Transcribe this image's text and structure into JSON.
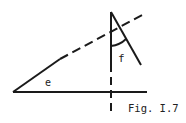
{
  "figure": {
    "caption": "Fig. I.7",
    "angle_labels": {
      "e": "e",
      "f": "f"
    },
    "colors": {
      "stroke": "#1a1a1a",
      "background": "#ffffff"
    },
    "elements": [
      {
        "name": "baseline",
        "style": "solid",
        "from": [
          13,
          92
        ],
        "to": [
          147,
          92
        ]
      },
      {
        "name": "slanted-line-solid",
        "style": "solid",
        "from": [
          13,
          92
        ],
        "to": [
          60,
          59
        ]
      },
      {
        "name": "slanted-line-dashed",
        "style": "dashed",
        "from": [
          60,
          59
        ],
        "to": [
          146,
          13
        ]
      },
      {
        "name": "vertical-line-solid",
        "style": "solid",
        "from": [
          111,
          12
        ],
        "to": [
          111,
          64
        ]
      },
      {
        "name": "vertical-line-dashed",
        "style": "dashed",
        "from": [
          111,
          64
        ],
        "to": [
          111,
          113
        ]
      },
      {
        "name": "apex-slant-line",
        "style": "solid",
        "from": [
          111,
          12
        ],
        "to": [
          141,
          65
        ]
      },
      {
        "name": "angle-f-arc",
        "style": "solid",
        "from": [
          111,
          46
        ],
        "to": [
          126,
          40
        ]
      }
    ]
  }
}
